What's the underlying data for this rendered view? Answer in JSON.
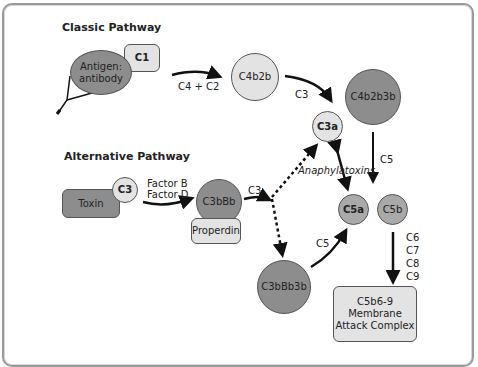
{
  "diagram": {
    "sections": {
      "classic": {
        "title": "Classic Pathway"
      },
      "alternative": {
        "title": "Alternative Pathway"
      }
    },
    "nodes": {
      "antigen_antibody": {
        "label_line1": "Antigen:",
        "label_line2": "antibody",
        "shape": "ellipse",
        "shade": "dark"
      },
      "c1": {
        "label": "C1",
        "shape": "rounded-rect",
        "shade": "light"
      },
      "c4b2b": {
        "label": "C4b2b",
        "shape": "circle",
        "shade": "light"
      },
      "c4b2b3b": {
        "label": "C4b2b3b",
        "shape": "circle",
        "shade": "dark"
      },
      "c3a": {
        "label": "C3a",
        "shape": "circle",
        "shade": "light"
      },
      "toxin": {
        "label": "Toxin",
        "shape": "rounded-rect",
        "shade": "dark"
      },
      "c3": {
        "label": "C3",
        "shape": "circle",
        "shade": "light"
      },
      "c3bbb": {
        "label": "C3bBb",
        "shape": "circle",
        "shade": "dark"
      },
      "properdin": {
        "label": "Properdin",
        "shape": "rounded-rect",
        "shade": "light"
      },
      "c3bbb3b": {
        "label": "C3bBb3b",
        "shape": "circle",
        "shade": "dark"
      },
      "c5a": {
        "label": "C5a",
        "shape": "circle",
        "shade": "mid"
      },
      "c5b": {
        "label": "C5b",
        "shape": "circle",
        "shade": "mid"
      },
      "mac": {
        "label_line1": "C5b6-9",
        "label_line2": "Membrane",
        "label_line3": "Attack Complex",
        "shape": "rounded-rect",
        "shade": "light"
      }
    },
    "edges": [
      {
        "from": "antigen_antibody",
        "to": "c4b2b",
        "label": "C4 + C2",
        "style": "solid"
      },
      {
        "from": "c4b2b",
        "to": "c4b2b3b",
        "label": "C3",
        "style": "solid"
      },
      {
        "from": "c4b2b3b",
        "to": "c5a/c5b",
        "label": "C5",
        "style": "solid"
      },
      {
        "from": "toxin",
        "to": "c3bbb",
        "label_line1": "Factor B",
        "label_line2": "Factor D",
        "style": "solid"
      },
      {
        "from": "c3bbb",
        "to": "split",
        "label": "C3",
        "style": "solid"
      },
      {
        "from": "split",
        "to": "c3a",
        "style": "dotted"
      },
      {
        "from": "split",
        "to": "c3bbb3b",
        "style": "dotted"
      },
      {
        "from": "c3bbb3b",
        "to": "c5a",
        "label": "C5",
        "style": "solid"
      },
      {
        "from": "c3a",
        "to": "c5a",
        "label": "Anaphylatoxins",
        "style": "double-headed"
      },
      {
        "from": "c5b",
        "to": "mac",
        "labels": [
          "C6",
          "C7",
          "C8",
          "C9"
        ],
        "style": "solid"
      }
    ],
    "labels": {
      "c4_c2": "C4 + C2",
      "c3_classic": "C3",
      "c5_classic": "C5",
      "factor_b": "Factor B",
      "factor_d": "Factor D",
      "c3_alt": "C3",
      "c5_alt": "C5",
      "anaphylatoxins": "Anaphylatoxins",
      "c6": "C6",
      "c7": "C7",
      "c8": "C8",
      "c9": "C9"
    },
    "colors": {
      "dark_fill": "#8d8d8d",
      "mid_fill": "#a9a9a9",
      "light_fill": "#e3e3e3",
      "stroke": "#111111",
      "frame": "#9a9a9a"
    }
  }
}
